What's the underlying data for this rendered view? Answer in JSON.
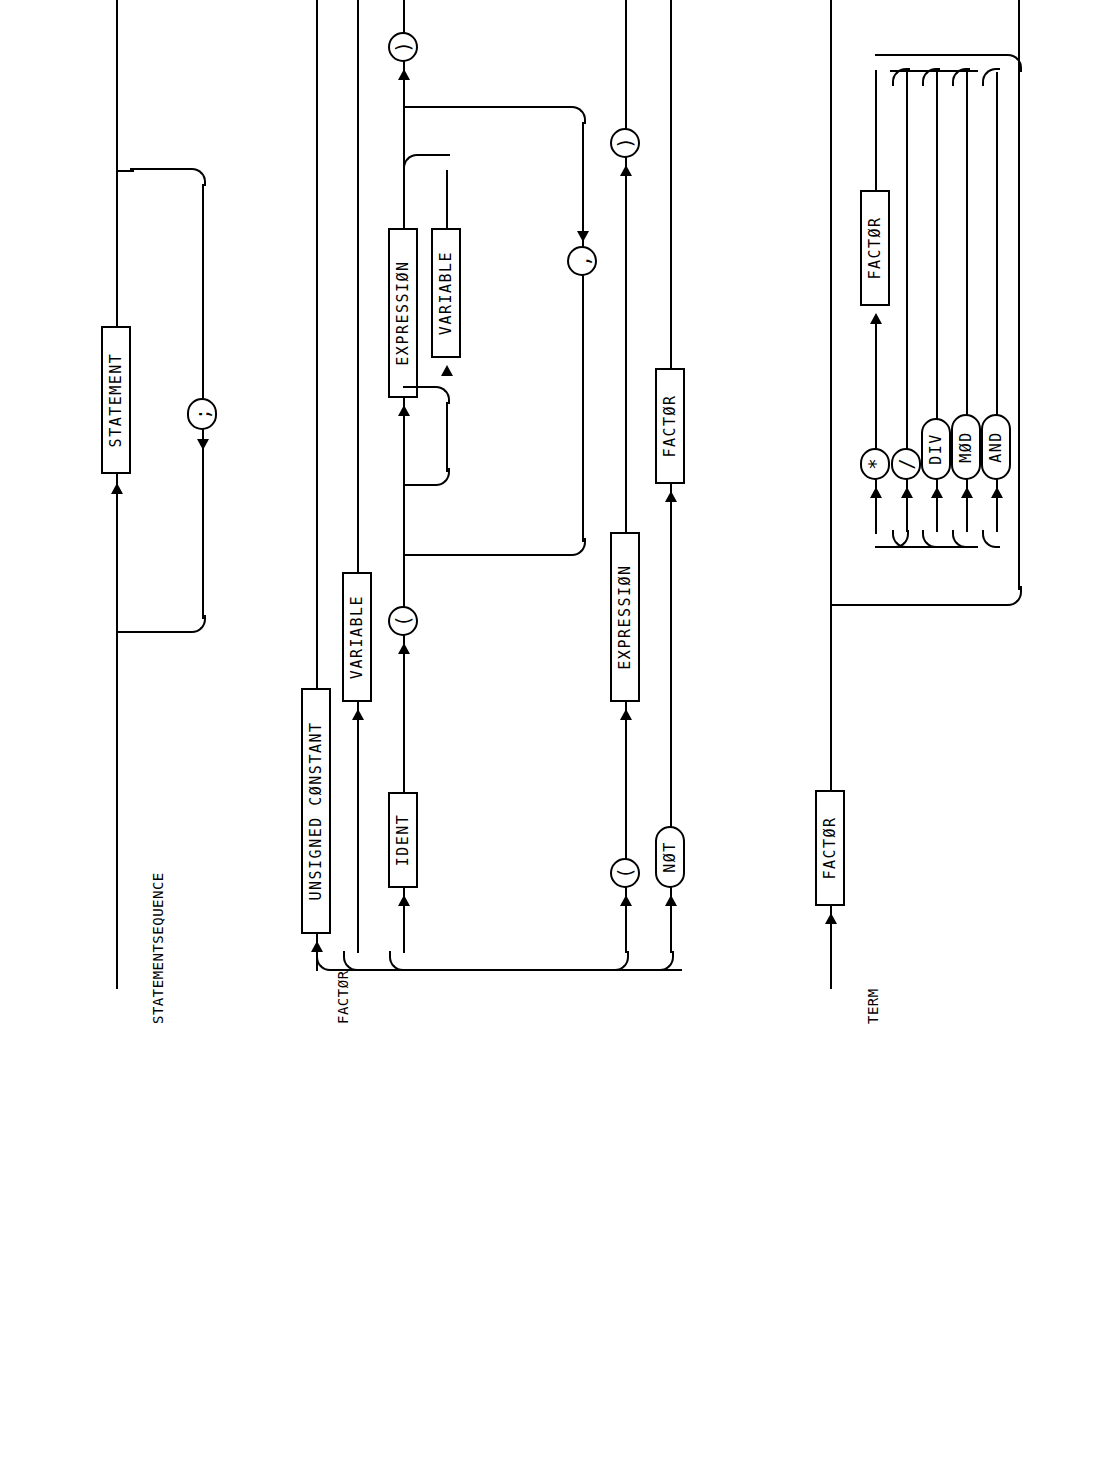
{
  "page": {
    "background_color": "#ffffff",
    "ink_color": "#000000",
    "orientation": "landscape-content-rotated-90ccw",
    "kind": "syntax-railroad-diagram-sheet"
  },
  "diagrams": [
    {
      "id": "statementsequence",
      "label": "STATEMENTSEQUENCE",
      "nonterminals": [
        {
          "key": "statement",
          "label": "STATEMENT"
        }
      ],
      "terminals": [
        {
          "key": "semicolon",
          "label": ";"
        }
      ],
      "structure": "STATEMENT repeated, separated by ';' (loop-back below the main rail)"
    },
    {
      "id": "factor",
      "label": "FACTØR",
      "nonterminals": [
        {
          "key": "unsigned_constant",
          "label": "UNSIGNED CØNSTANT"
        },
        {
          "key": "variable_alt",
          "label": "VARIABLE"
        },
        {
          "key": "ident",
          "label": "IDENT"
        },
        {
          "key": "expression_args",
          "label": "EXPRESSIØN"
        },
        {
          "key": "variable_args",
          "label": "VARIABLE"
        },
        {
          "key": "expression_paren",
          "label": "EXPRESSIØN"
        },
        {
          "key": "not_factor",
          "label": "FACTØR"
        }
      ],
      "terminals": [
        {
          "key": "lparen_call",
          "label": "("
        },
        {
          "key": "comma",
          "label": ","
        },
        {
          "key": "rparen_call",
          "label": ")"
        },
        {
          "key": "lparen_expr",
          "label": "("
        },
        {
          "key": "rparen_expr",
          "label": ")"
        },
        {
          "key": "not",
          "label": "NØT"
        }
      ],
      "structure": "Alternatives: UNSIGNED CØNSTANT | VARIABLE | IDENT '(' {EXPRESSIØN|VARIABLE} ',' ... ')' | '(' EXPRESSIØN ')' | NØT FACTØR"
    },
    {
      "id": "term",
      "label": "TERM",
      "nonterminals": [
        {
          "key": "factor_first",
          "label": "FACTØR"
        },
        {
          "key": "factor_loop",
          "label": "FACTØR"
        }
      ],
      "terminals": [
        {
          "key": "op_mul",
          "label": "*"
        },
        {
          "key": "op_div_slash",
          "label": "/"
        },
        {
          "key": "op_div",
          "label": "DIV"
        },
        {
          "key": "op_mod",
          "label": "MØD"
        },
        {
          "key": "op_and",
          "label": "AND"
        }
      ],
      "structure": "FACTØR { ( '*' | '/' | DIV | MØD | AND ) FACTØR }"
    }
  ]
}
